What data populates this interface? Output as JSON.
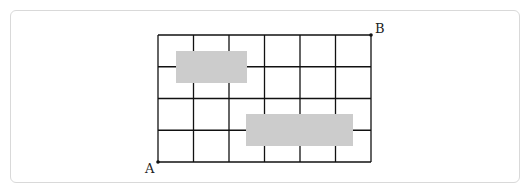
{
  "diagram": {
    "type": "grid-path",
    "columns": 6,
    "rows": 4,
    "grid": {
      "left": 158,
      "top": 35,
      "right": 371,
      "bottom": 162
    },
    "points": [
      {
        "label": "A",
        "corner": "bottom-left"
      },
      {
        "label": "B",
        "corner": "top-right"
      }
    ],
    "blocked_regions": [
      {
        "name": "shaded-rect-1",
        "x1": 176,
        "y1": 51,
        "x2": 247,
        "y2": 83
      },
      {
        "name": "shaded-rect-2",
        "x1": 246,
        "y1": 114,
        "x2": 353,
        "y2": 146
      }
    ],
    "colors": {
      "line": "#111111",
      "shade": "#cccccc"
    }
  }
}
